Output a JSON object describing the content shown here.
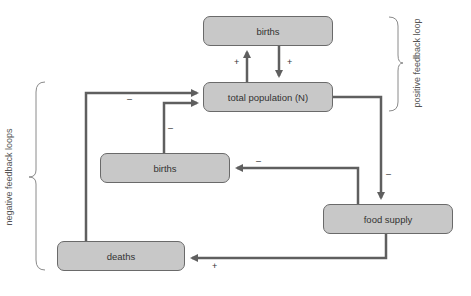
{
  "diagram": {
    "nodes": {
      "births_top": "births",
      "total_population": "total population (N)",
      "births_mid": "births",
      "food_supply": "food supply",
      "deaths": "deaths"
    },
    "edges": [
      {
        "from": "total_population",
        "to": "births_top",
        "sign": "+"
      },
      {
        "from": "births_top",
        "to": "total_population",
        "sign": "+"
      },
      {
        "from": "total_population",
        "to": "food_supply",
        "sign": "–"
      },
      {
        "from": "food_supply",
        "to": "births_mid",
        "sign": "–"
      },
      {
        "from": "births_mid",
        "to": "total_population",
        "sign": "–"
      },
      {
        "from": "food_supply",
        "to": "deaths",
        "sign": "+"
      },
      {
        "from": "deaths",
        "to": "total_population",
        "sign": "–"
      }
    ],
    "signs": {
      "pop_to_births": "+",
      "births_to_pop": "+",
      "pop_to_food": "–",
      "food_to_births": "–",
      "births_to_pop_neg": "–",
      "food_to_deaths": "+",
      "deaths_to_pop": "–"
    },
    "braces": {
      "positive": "positive feedback loop",
      "negative": "negative feedback loops"
    },
    "colors": {
      "box_fill": "#c8c8c8",
      "box_border": "#6a6a6a",
      "arrow": "#5f5f5f"
    }
  }
}
